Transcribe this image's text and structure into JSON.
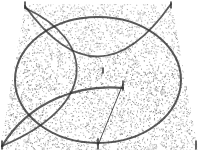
{
  "diagram": {
    "width": 198,
    "height": 153,
    "style": "stippled",
    "colors": {
      "background": "#ffffff",
      "stipple": "#6a6a6a",
      "stroke": "#2e2e2e"
    },
    "plane": {
      "shape": "trapezoid",
      "points": [
        [
          25,
          4
        ],
        [
          172,
          4
        ],
        [
          198,
          150
        ],
        [
          0,
          150
        ]
      ]
    },
    "ellipse": {
      "cx": 98,
      "cy": 80,
      "rx": 83,
      "ry": 63
    },
    "arcs": [
      {
        "name": "top-arc",
        "d": "M 25 6 Q 98 108 171 4"
      },
      {
        "name": "left-arc",
        "d": "M 25 8 C 95 40 100 105 2 146"
      },
      {
        "name": "lower-left-arc",
        "d": "M 2 146 C 30 100 80 84 123 88"
      }
    ],
    "segment": {
      "x1": 123,
      "y1": 84,
      "x2": 98,
      "y2": 145
    },
    "ticks": [
      {
        "x": 25,
        "y1": 2,
        "y2": 8
      },
      {
        "x": 171,
        "y1": 2,
        "y2": 8
      },
      {
        "x": 103,
        "y1": 68,
        "y2": 73
      },
      {
        "x": 123,
        "y1": 81,
        "y2": 90
      },
      {
        "x": 2,
        "y1": 141,
        "y2": 149
      },
      {
        "x": 98,
        "y1": 139,
        "y2": 149
      },
      {
        "x": 196,
        "y1": 141,
        "y2": 149
      }
    ],
    "stipple_seed": 7,
    "stipple_density": 5200
  }
}
